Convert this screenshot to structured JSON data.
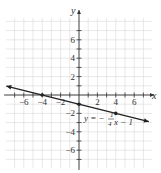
{
  "chart_data": {
    "type": "line",
    "title": "",
    "xlabel": "x",
    "ylabel": "y",
    "xlim": [
      -8,
      8
    ],
    "ylim": [
      -8,
      8
    ],
    "grid": true,
    "x_ticks": [
      -6,
      -4,
      -2,
      2,
      4,
      6
    ],
    "y_ticks": [
      -6,
      -4,
      -2,
      2,
      4,
      6
    ],
    "x_tick_labels": [
      "−6",
      "−4",
      "−2",
      "2",
      "4",
      "6"
    ],
    "y_tick_labels": [
      "−6",
      "−4",
      "−2",
      "2",
      "4",
      "6"
    ],
    "series": [
      {
        "name": "y = -1/4 x - 1",
        "equation": "y = −(1/4)x − 1",
        "slope": -0.25,
        "intercept": -1,
        "x": [
          -8,
          8
        ],
        "y": [
          1,
          -3
        ],
        "arrows": "both"
      }
    ],
    "points": [
      {
        "x": -4,
        "y": 0
      },
      {
        "x": 0,
        "y": -1
      },
      {
        "x": 4,
        "y": -2
      }
    ],
    "annotations": [
      {
        "text_prefix": "y = −",
        "fraction_num": "1",
        "fraction_den": "4",
        "text_suffix": "x − 1",
        "x": 1.6,
        "y": -2.7
      }
    ]
  },
  "labels": {
    "x_axis": "x",
    "y_axis": "y",
    "eq_prefix": "y = −",
    "eq_num": "1",
    "eq_den": "4",
    "eq_suffix": "x − 1"
  },
  "colors": {
    "grid": "#d9d9d9",
    "axis": "#333333",
    "line": "#222222"
  }
}
